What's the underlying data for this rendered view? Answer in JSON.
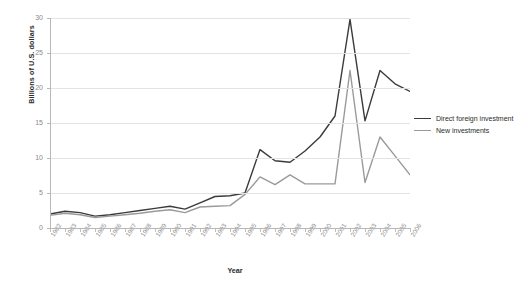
{
  "chart_data": {
    "type": "line",
    "title": "",
    "xlabel": "Year",
    "ylabel": "Billions of U.S. dollars",
    "ylim": [
      0,
      30
    ],
    "ytick_values": [
      0,
      5,
      10,
      15,
      20,
      25,
      30
    ],
    "grid": true,
    "legend_position": "right",
    "categories": [
      "1982",
      "1983",
      "1984",
      "1985",
      "1986",
      "1987",
      "1988",
      "1989",
      "1990",
      "1991",
      "1992",
      "1993",
      "1994",
      "1995",
      "1996",
      "1997",
      "1998",
      "1999",
      "2000",
      "2001",
      "2002",
      "2003",
      "2004",
      "2005",
      "2006"
    ],
    "series": [
      {
        "name": "Direct foreign investment",
        "color": "#3b3b3b",
        "values": [
          2.0,
          2.4,
          2.2,
          1.7,
          1.9,
          2.2,
          2.5,
          2.8,
          3.1,
          2.7,
          3.6,
          4.5,
          4.6,
          5.0,
          11.2,
          9.6,
          9.4,
          11.0,
          13.0,
          16.0,
          29.8,
          15.3,
          22.5,
          20.6,
          19.5
        ]
      },
      {
        "name": "New investments",
        "color": "#9a9a9a",
        "values": [
          1.8,
          2.1,
          1.9,
          1.5,
          1.7,
          1.9,
          2.1,
          2.4,
          2.6,
          2.2,
          3.0,
          3.1,
          3.2,
          4.8,
          7.3,
          6.2,
          7.6,
          6.3,
          6.3,
          6.3,
          22.5,
          6.5,
          13.0,
          10.3,
          7.6
        ]
      }
    ]
  }
}
